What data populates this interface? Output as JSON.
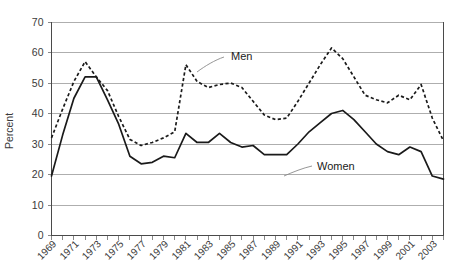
{
  "chart_data": {
    "type": "line",
    "title": "",
    "xlabel": "",
    "ylabel": "Percent",
    "ylim": [
      0,
      70
    ],
    "ytick_step": 10,
    "yticks": [
      0,
      10,
      20,
      30,
      40,
      50,
      60,
      70
    ],
    "grid": true,
    "legend_position": "inline-annotations",
    "xlim": [
      1969,
      2004
    ],
    "x": [
      1969,
      1970,
      1971,
      1972,
      1973,
      1974,
      1975,
      1976,
      1977,
      1978,
      1979,
      1980,
      1981,
      1982,
      1983,
      1984,
      1985,
      1986,
      1987,
      1988,
      1989,
      1990,
      1991,
      1992,
      1993,
      1994,
      1995,
      1996,
      1997,
      1998,
      1999,
      2000,
      2001,
      2002,
      2003,
      2004
    ],
    "xticks_labeled": [
      "1969",
      "1971",
      "1973",
      "1975",
      "1977",
      "1979",
      "1981",
      "1983",
      "1985",
      "1987",
      "1989",
      "1991",
      "1993",
      "1995",
      "1997",
      "1999",
      "2001",
      "2003"
    ],
    "series": [
      {
        "name": "Men",
        "style": "dashed",
        "values": [
          32.0,
          41.5,
          50.5,
          57.0,
          52.0,
          47.5,
          39.0,
          31.5,
          29.5,
          30.5,
          32.0,
          34.0,
          56.0,
          50.5,
          48.5,
          49.5,
          50.0,
          48.5,
          44.0,
          39.5,
          38.0,
          38.5,
          44.0,
          50.0,
          56.0,
          61.5,
          58.0,
          52.0,
          46.0,
          44.5,
          43.5,
          46.0,
          44.5,
          49.5,
          38.5,
          31.0
        ]
      },
      {
        "name": "Women",
        "style": "solid",
        "values": [
          19.5,
          33.0,
          45.0,
          52.0,
          52.0,
          44.5,
          36.5,
          26.0,
          23.5,
          24.0,
          26.0,
          25.5,
          33.5,
          30.5,
          30.5,
          33.5,
          30.5,
          29.0,
          29.5,
          26.5,
          26.5,
          26.5,
          30.0,
          34.0,
          37.0,
          40.0,
          41.0,
          38.0,
          34.0,
          30.0,
          27.5,
          26.5,
          29.0,
          27.5,
          19.5,
          18.5
        ]
      }
    ],
    "annotations": [
      {
        "label": "Men",
        "series": "Men"
      },
      {
        "label": "Women",
        "series": "Women"
      }
    ]
  }
}
